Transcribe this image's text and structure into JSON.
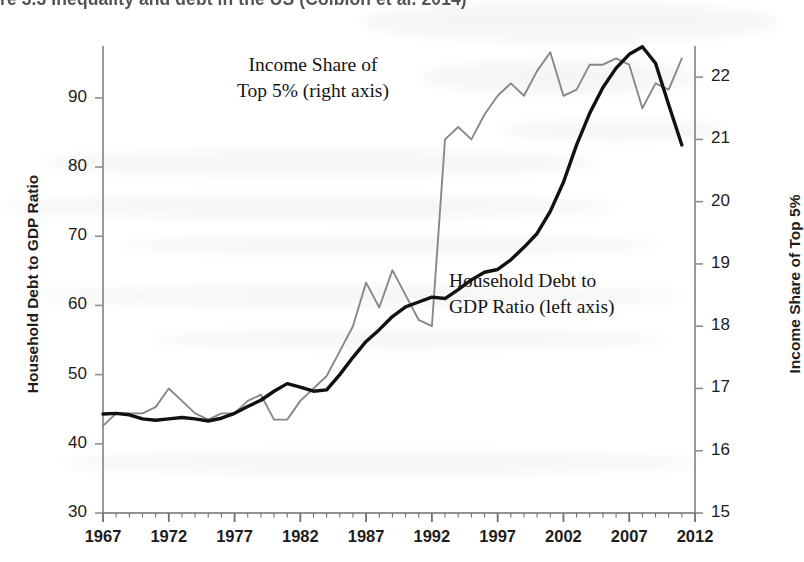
{
  "figure": {
    "title": "re 3.3  Inequality and debt in the US (Coibion et al. 2014)"
  },
  "chart_data": {
    "type": "line",
    "title": "Inequality and debt in the US (Coibion et al. 2014)",
    "xlabel": "",
    "ylabel": "Household Debt to GDP Ratio",
    "y2label": "Income Share of Top 5%",
    "grid": false,
    "legend_position": "inline-annotations",
    "xlim": [
      1967,
      2012
    ],
    "ylim": [
      30,
      97.5
    ],
    "y2lim": [
      15,
      22.5
    ],
    "yticks": [
      30,
      40,
      50,
      60,
      70,
      80,
      90
    ],
    "y2ticks": [
      15,
      16,
      17,
      18,
      19,
      20,
      21,
      22
    ],
    "xticks": [
      1967,
      1972,
      1977,
      1982,
      1987,
      1992,
      1997,
      2002,
      2007,
      2012
    ],
    "x": [
      1967,
      1968,
      1969,
      1970,
      1971,
      1972,
      1973,
      1974,
      1975,
      1976,
      1977,
      1978,
      1979,
      1980,
      1981,
      1982,
      1983,
      1984,
      1985,
      1986,
      1987,
      1988,
      1989,
      1990,
      1991,
      1992,
      1993,
      1994,
      1995,
      1996,
      1997,
      1998,
      1999,
      2000,
      2001,
      2002,
      2003,
      2004,
      2005,
      2006,
      2007,
      2008,
      2009,
      2010,
      2011
    ],
    "series": [
      {
        "name": "Household Debt to GDP Ratio (left axis)",
        "axis": "left",
        "color": "#111111",
        "width": 3.4,
        "values": [
          44.3,
          44.4,
          44.2,
          43.6,
          43.4,
          43.6,
          43.8,
          43.6,
          43.3,
          43.7,
          44.4,
          45.4,
          46.3,
          47.6,
          48.7,
          48.2,
          47.6,
          47.8,
          50.0,
          52.5,
          54.8,
          56.5,
          58.4,
          59.8,
          60.5,
          61.2,
          61.0,
          62.3,
          63.7,
          64.8,
          65.2,
          66.6,
          68.4,
          70.4,
          73.6,
          77.8,
          83.2,
          87.8,
          91.5,
          94.3,
          96.3,
          97.4,
          95.0,
          89.0,
          83.2
        ]
      },
      {
        "name": "Income Share of Top 5% (right axis)",
        "axis": "right",
        "color": "#888888",
        "width": 1.9,
        "values": [
          16.4,
          16.6,
          16.6,
          16.6,
          16.7,
          17.0,
          16.8,
          16.6,
          16.5,
          16.6,
          16.6,
          16.8,
          16.9,
          16.5,
          16.5,
          16.8,
          17.0,
          17.2,
          17.6,
          18.0,
          18.7,
          18.3,
          18.9,
          18.5,
          18.1,
          18.0,
          21.0,
          21.2,
          21.0,
          21.4,
          21.7,
          21.9,
          21.7,
          22.1,
          22.4,
          21.7,
          21.8,
          22.2,
          22.2,
          22.3,
          22.2,
          21.5,
          21.9,
          21.8,
          22.3
        ]
      }
    ],
    "annotations": [
      {
        "text_lines": [
          "Income Share of",
          "Top 5% (right axis)"
        ],
        "x": 1975,
        "y": 93
      },
      {
        "text_lines": [
          "Household Debt to",
          "GDP Ratio (left axis)"
        ],
        "x": 1994,
        "y": 62
      }
    ]
  },
  "axes": {
    "left_title": "Household Debt to GDP Ratio",
    "right_title": "Income Share of Top 5%",
    "left_ticks": [
      "90",
      "80",
      "70",
      "60",
      "50",
      "40",
      "30"
    ],
    "right_ticks": [
      "22",
      "21",
      "20",
      "19",
      "18",
      "17",
      "16",
      "15"
    ],
    "x_ticks": [
      "1967",
      "1972",
      "1977",
      "1982",
      "1987",
      "1992",
      "1997",
      "2002",
      "2007",
      "2012"
    ]
  },
  "annotations": {
    "income_share": {
      "line1": "Income Share of",
      "line2": "Top 5% (right axis)"
    },
    "household_debt": {
      "line1": "Household Debt to",
      "line2": "GDP Ratio (left axis)"
    }
  }
}
